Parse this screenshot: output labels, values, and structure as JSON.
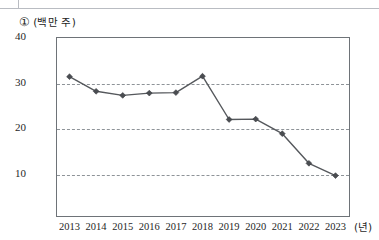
{
  "figure": {
    "label_marker": "①",
    "unit_label": "(백만 주)",
    "x_axis_unit": "(년)"
  },
  "chart_data": {
    "type": "line",
    "xlabel": "(년)",
    "ylabel": "(백만 주)",
    "categories": [
      "2013",
      "2014",
      "2015",
      "2016",
      "2017",
      "2018",
      "2019",
      "2020",
      "2021",
      "2022",
      "2023"
    ],
    "values": [
      31.3,
      28.1,
      27.2,
      27.7,
      27.8,
      31.4,
      21.9,
      22.0,
      18.8,
      12.3,
      9.6
    ],
    "ylim": [
      0,
      40
    ],
    "yticks": [
      10,
      20,
      30,
      40
    ],
    "ytick_labels": [
      "10",
      "20",
      "30",
      "40"
    ],
    "grid": "horizontal-dashed",
    "gridlines_at": [
      10,
      20,
      30
    ],
    "legend": "none",
    "marker": "diamond",
    "line_color": "#55585c",
    "marker_color": "#4a4d51",
    "grid_color": "#8e9398",
    "axis_color": "#6e7378"
  }
}
